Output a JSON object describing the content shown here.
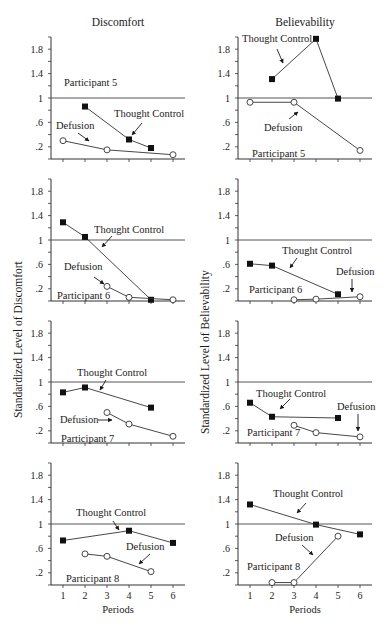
{
  "columns": [
    {
      "title": "Discomfort",
      "ylabel": "Standardized Level of Discomfort"
    },
    {
      "title": "Believability",
      "ylabel": "Standardized Level of Believability"
    }
  ],
  "xlabel": "Periods",
  "chart_data": [
    {
      "type": "line",
      "column": "Discomfort",
      "participant": "Participant 5",
      "x": [
        1,
        2,
        3,
        4,
        5,
        6
      ],
      "ylim": [
        0,
        2
      ],
      "yticks": [
        0.2,
        0.6,
        1,
        1.4,
        1.8
      ],
      "ytick_labels": [
        ".2",
        ".6",
        "1",
        "1.4",
        "1.8"
      ],
      "reference_line": 1,
      "series": [
        {
          "name": "Thought Control",
          "marker": "filled-square",
          "points": [
            [
              2,
              0.86
            ],
            [
              4,
              0.32
            ],
            [
              5,
              0.18
            ]
          ]
        },
        {
          "name": "Defusion",
          "marker": "open-circle",
          "points": [
            [
              1,
              0.3
            ],
            [
              3,
              0.15
            ],
            [
              6,
              0.07
            ]
          ]
        }
      ]
    },
    {
      "type": "line",
      "column": "Believability",
      "participant": "Participant 5",
      "x": [
        1,
        2,
        3,
        4,
        5,
        6
      ],
      "ylim": [
        0,
        2
      ],
      "yticks": [
        0.2,
        0.6,
        1,
        1.4,
        1.8
      ],
      "ytick_labels": [
        ".2",
        ".6",
        "1",
        "1.4",
        "1.8"
      ],
      "reference_line": 1,
      "series": [
        {
          "name": "Thought Control",
          "marker": "filled-square",
          "points": [
            [
              2,
              1.31
            ],
            [
              4,
              1.97
            ],
            [
              5,
              0.99
            ]
          ]
        },
        {
          "name": "Defusion",
          "marker": "open-circle",
          "points": [
            [
              1,
              0.93
            ],
            [
              3,
              0.93
            ],
            [
              6,
              0.14
            ]
          ]
        }
      ]
    },
    {
      "type": "line",
      "column": "Discomfort",
      "participant": "Participant 6",
      "x": [
        1,
        2,
        3,
        4,
        5,
        6
      ],
      "ylim": [
        0,
        2
      ],
      "yticks": [
        0.2,
        0.6,
        1,
        1.4,
        1.8
      ],
      "ytick_labels": [
        ".2",
        ".6",
        "1",
        "1.4",
        "1.8"
      ],
      "reference_line": 1,
      "series": [
        {
          "name": "Thought Control",
          "marker": "filled-square",
          "points": [
            [
              1,
              1.29
            ],
            [
              2,
              1.05
            ],
            [
              5,
              0.02
            ]
          ]
        },
        {
          "name": "Defusion",
          "marker": "open-circle",
          "points": [
            [
              3,
              0.24
            ],
            [
              4,
              0.06
            ],
            [
              6,
              0.02
            ]
          ]
        }
      ]
    },
    {
      "type": "line",
      "column": "Believability",
      "participant": "Participant 6",
      "x": [
        1,
        2,
        3,
        4,
        5,
        6
      ],
      "ylim": [
        0,
        2
      ],
      "yticks": [
        0.2,
        0.6,
        1,
        1.4,
        1.8
      ],
      "ytick_labels": [
        ".2",
        ".6",
        "1",
        "1.4",
        "1.8"
      ],
      "reference_line": 1,
      "series": [
        {
          "name": "Thought Control",
          "marker": "filled-square",
          "points": [
            [
              1,
              0.61
            ],
            [
              2,
              0.58
            ],
            [
              5,
              0.11
            ]
          ]
        },
        {
          "name": "Defusion",
          "marker": "open-circle",
          "points": [
            [
              3,
              0.02
            ],
            [
              4,
              0.03
            ],
            [
              6,
              0.07
            ]
          ]
        }
      ]
    },
    {
      "type": "line",
      "column": "Discomfort",
      "participant": "Participant 7",
      "x": [
        1,
        2,
        3,
        4,
        5,
        6
      ],
      "ylim": [
        0,
        2
      ],
      "yticks": [
        0.2,
        0.6,
        1,
        1.4,
        1.8
      ],
      "ytick_labels": [
        ".2",
        ".6",
        "1",
        "1.4",
        "1.8"
      ],
      "reference_line": 1,
      "series": [
        {
          "name": "Thought Control",
          "marker": "filled-square",
          "points": [
            [
              1,
              0.83
            ],
            [
              2,
              0.91
            ],
            [
              5,
              0.58
            ]
          ]
        },
        {
          "name": "Defusion",
          "marker": "open-circle",
          "points": [
            [
              3,
              0.5
            ],
            [
              4,
              0.31
            ],
            [
              6,
              0.11
            ]
          ]
        }
      ]
    },
    {
      "type": "line",
      "column": "Believability",
      "participant": "Participant 7",
      "x": [
        1,
        2,
        3,
        4,
        5,
        6
      ],
      "ylim": [
        0,
        2
      ],
      "yticks": [
        0.2,
        0.6,
        1,
        1.4,
        1.8
      ],
      "ytick_labels": [
        ".2",
        ".6",
        "1",
        "1.4",
        "1.8"
      ],
      "reference_line": 1,
      "series": [
        {
          "name": "Thought Control",
          "marker": "filled-square",
          "points": [
            [
              1,
              0.66
            ],
            [
              2,
              0.43
            ],
            [
              5,
              0.41
            ]
          ]
        },
        {
          "name": "Defusion",
          "marker": "open-circle",
          "points": [
            [
              3,
              0.29
            ],
            [
              4,
              0.17
            ],
            [
              6,
              0.1
            ]
          ]
        }
      ]
    },
    {
      "type": "line",
      "column": "Discomfort",
      "participant": "Participant 8",
      "x": [
        1,
        2,
        3,
        4,
        5,
        6
      ],
      "ylim": [
        0,
        2
      ],
      "yticks": [
        0.2,
        0.6,
        1,
        1.4,
        1.8
      ],
      "ytick_labels": [
        ".2",
        ".6",
        "1",
        "1.4",
        "1.8"
      ],
      "reference_line": 1,
      "series": [
        {
          "name": "Thought Control",
          "marker": "filled-square",
          "points": [
            [
              1,
              0.73
            ],
            [
              4,
              0.89
            ],
            [
              6,
              0.69
            ]
          ]
        },
        {
          "name": "Defusion",
          "marker": "open-circle",
          "points": [
            [
              2,
              0.51
            ],
            [
              3,
              0.47
            ],
            [
              5,
              0.22
            ]
          ]
        }
      ]
    },
    {
      "type": "line",
      "column": "Believability",
      "participant": "Participant 8",
      "x": [
        1,
        2,
        3,
        4,
        5,
        6
      ],
      "ylim": [
        0,
        2
      ],
      "yticks": [
        0.2,
        0.6,
        1,
        1.4,
        1.8
      ],
      "ytick_labels": [
        ".2",
        ".6",
        "1",
        "1.4",
        "1.8"
      ],
      "reference_line": 1,
      "series": [
        {
          "name": "Thought Control",
          "marker": "filled-square",
          "points": [
            [
              1,
              1.32
            ],
            [
              4,
              0.99
            ],
            [
              6,
              0.83
            ]
          ]
        },
        {
          "name": "Defusion",
          "marker": "open-circle",
          "points": [
            [
              2,
              0.04
            ],
            [
              3,
              0.04
            ],
            [
              5,
              0.8
            ]
          ]
        }
      ]
    }
  ],
  "annotations": [
    {
      "panel": 0,
      "items": [
        {
          "text": "Participant 5",
          "x": 64,
          "y": 86
        },
        {
          "text": "Thought Control",
          "x": 114,
          "y": 117,
          "arrow": [
            [
              142,
              123
            ],
            [
              132,
              135
            ]
          ]
        },
        {
          "text": "Defusion",
          "x": 56,
          "y": 129,
          "arrow": [
            [
              78,
              133
            ],
            [
              89,
              141
            ]
          ]
        }
      ]
    },
    {
      "panel": 1,
      "items": [
        {
          "text": "Thought Control",
          "x": 242,
          "y": 42,
          "arrow": [
            [
              277,
              49
            ],
            [
              283,
              63
            ]
          ]
        },
        {
          "text": "Defusion",
          "x": 264,
          "y": 131,
          "arrow": [
            [
              289,
              119
            ],
            [
              298,
              112
            ]
          ]
        },
        {
          "text": "Participant 5",
          "x": 252,
          "y": 157
        }
      ]
    },
    {
      "panel": 2,
      "items": [
        {
          "text": "Thought Control",
          "x": 94,
          "y": 233,
          "arrow": [
            [
              112,
              236
            ],
            [
              102,
              247
            ]
          ]
        },
        {
          "text": "Defusion",
          "x": 64,
          "y": 270,
          "arrow": [
            [
              94,
              277
            ],
            [
              104,
              284
            ]
          ]
        },
        {
          "text": "Participant 6",
          "x": 57,
          "y": 299
        }
      ]
    },
    {
      "panel": 3,
      "items": [
        {
          "text": "Thought Control",
          "x": 282,
          "y": 254,
          "arrow": [
            [
              297,
              258
            ],
            [
              290,
              268
            ]
          ]
        },
        {
          "text": "Defusion",
          "x": 336,
          "y": 275,
          "arrow": [
            [
              352,
              279
            ],
            [
              352,
              292
            ]
          ]
        },
        {
          "text": "Participant 6",
          "x": 249,
          "y": 293
        }
      ]
    },
    {
      "panel": 4,
      "items": [
        {
          "text": "Thought Control",
          "x": 77,
          "y": 376,
          "arrow": [
            [
              106,
              380
            ],
            [
              100,
              390
            ]
          ]
        },
        {
          "text": "Defusion",
          "x": 60,
          "y": 423,
          "arrow": [
            [
              98,
              420
            ],
            [
              112,
              420
            ]
          ]
        },
        {
          "text": "Participant 7",
          "x": 61,
          "y": 442
        }
      ]
    },
    {
      "panel": 5,
      "items": [
        {
          "text": "Thought Control",
          "x": 256,
          "y": 397,
          "arrow": [
            [
              290,
              399
            ],
            [
              280,
              409
            ]
          ]
        },
        {
          "text": "Defusion",
          "x": 337,
          "y": 410,
          "arrow": [
            [
              358,
              414
            ],
            [
              358,
              431
            ]
          ]
        },
        {
          "text": "Participant 7",
          "x": 247,
          "y": 436
        }
      ]
    },
    {
      "panel": 6,
      "items": [
        {
          "text": "Thought Control",
          "x": 76,
          "y": 516,
          "arrow": [
            [
              113,
              521
            ],
            [
              119,
              530
            ]
          ]
        },
        {
          "text": "Defusion",
          "x": 126,
          "y": 550,
          "arrow": [
            [
              150,
              554
            ],
            [
              139,
              564
            ]
          ]
        },
        {
          "text": "Participant 8",
          "x": 66,
          "y": 582
        }
      ]
    },
    {
      "panel": 7,
      "items": [
        {
          "text": "Thought Control",
          "x": 273,
          "y": 497,
          "arrow": [
            [
              306,
              503
            ],
            [
              297,
              513
            ]
          ]
        },
        {
          "text": "Defusion",
          "x": 275,
          "y": 541,
          "arrow": [
            [
              302,
              545
            ],
            [
              313,
              555
            ]
          ]
        },
        {
          "text": "Participant 8",
          "x": 247,
          "y": 570
        }
      ]
    }
  ],
  "caption": ""
}
